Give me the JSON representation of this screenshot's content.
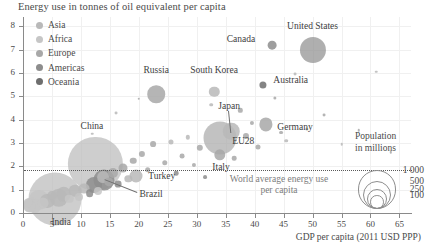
{
  "chart_data": {
    "type": "scatter",
    "title": "Energy use in tonnes of oil equivalent per capita",
    "xlabel": "GDP per capita (2011 USD PPP)",
    "ylabel": "Energy use in tonnes of oil equivalent per capita",
    "xlim": [
      0,
      67
    ],
    "ylim": [
      0,
      8.4
    ],
    "xticks": [
      "0",
      "5",
      "10",
      "15",
      "20",
      "25",
      "30",
      "35",
      "40",
      "45",
      "50",
      "55",
      "60",
      "65"
    ],
    "xtick_values": [
      0,
      5,
      10,
      15,
      20,
      25,
      30,
      35,
      40,
      45,
      50,
      55,
      60,
      65
    ],
    "yticks": [
      "0",
      "1",
      "2",
      "3",
      "4",
      "5",
      "6",
      "7",
      "8"
    ],
    "ytick_values": [
      0,
      1,
      2,
      3,
      4,
      5,
      6,
      7,
      8
    ],
    "grid": true,
    "legend_position": "top-left",
    "size_encoding": "Population in millions",
    "legend": [
      {
        "label": "Asia",
        "color": "#b9b9b9"
      },
      {
        "label": "Africa",
        "color": "#c6c6c6"
      },
      {
        "label": "Europe",
        "color": "#a8a8a8"
      },
      {
        "label": "Americas",
        "color": "#8d8d8d"
      },
      {
        "label": "Oceania",
        "color": "#6e6e6e"
      }
    ],
    "annotations": [
      {
        "text": "World average energy use per capita",
        "y_value": 1.85,
        "kind": "reference-line"
      }
    ],
    "size_legend": {
      "title_line1": "Population",
      "title_line2": "in millions",
      "entries": [
        "1 000",
        "500",
        "250",
        "100"
      ],
      "values": [
        1000,
        500,
        250,
        100
      ]
    },
    "labeled_points": [
      {
        "name": "United States",
        "x": 50.0,
        "y": 7.0,
        "pop": 320,
        "region": "Americas"
      },
      {
        "name": "Canada",
        "x": 43.0,
        "y": 7.2,
        "pop": 36,
        "region": "Americas"
      },
      {
        "name": "Australia",
        "x": 41.5,
        "y": 5.5,
        "pop": 24,
        "region": "Oceania"
      },
      {
        "name": "South Korea",
        "x": 33.0,
        "y": 5.2,
        "pop": 51,
        "region": "Asia"
      },
      {
        "name": "Russia",
        "x": 23.0,
        "y": 5.1,
        "pop": 144,
        "region": "Europe"
      },
      {
        "name": "Germany",
        "x": 42.0,
        "y": 3.8,
        "pop": 82,
        "region": "Europe"
      },
      {
        "name": "Japan",
        "x": 36.0,
        "y": 3.5,
        "pop": 127,
        "region": "Asia"
      },
      {
        "name": "EU28",
        "x": 34.0,
        "y": 3.2,
        "pop": 510,
        "region": "Europe"
      },
      {
        "name": "Italy",
        "x": 34.0,
        "y": 2.5,
        "pop": 61,
        "region": "Europe"
      },
      {
        "name": "China",
        "x": 12.5,
        "y": 2.1,
        "pop": 1380,
        "region": "Asia"
      },
      {
        "name": "Turkey",
        "x": 19.5,
        "y": 1.6,
        "pop": 79,
        "region": "Asia"
      },
      {
        "name": "Brazil",
        "x": 14.0,
        "y": 1.4,
        "pop": 208,
        "region": "Americas"
      },
      {
        "name": "India",
        "x": 5.5,
        "y": 0.6,
        "pop": 1320,
        "region": "Asia"
      }
    ],
    "other_points": [
      {
        "x": 2.0,
        "y": 0.3,
        "pop": 90,
        "region": "Africa"
      },
      {
        "x": 1.4,
        "y": 0.36,
        "pop": 105,
        "region": "Africa"
      },
      {
        "x": 1.1,
        "y": 0.28,
        "pop": 60,
        "region": "Africa"
      },
      {
        "x": 0.9,
        "y": 0.45,
        "pop": 40,
        "region": "Africa"
      },
      {
        "x": 2.8,
        "y": 0.55,
        "pop": 190,
        "region": "Africa"
      },
      {
        "x": 3.4,
        "y": 0.42,
        "pop": 55,
        "region": "Africa"
      },
      {
        "x": 4.2,
        "y": 0.52,
        "pop": 95,
        "region": "Asia"
      },
      {
        "x": 5.0,
        "y": 0.75,
        "pop": 45,
        "region": "Asia"
      },
      {
        "x": 6.2,
        "y": 0.66,
        "pop": 160,
        "region": "Asia"
      },
      {
        "x": 7.0,
        "y": 0.8,
        "pop": 100,
        "region": "Asia"
      },
      {
        "x": 8.0,
        "y": 0.62,
        "pop": 35,
        "region": "Africa"
      },
      {
        "x": 9.0,
        "y": 0.95,
        "pop": 75,
        "region": "Asia"
      },
      {
        "x": 9.6,
        "y": 0.7,
        "pop": 30,
        "region": "Africa"
      },
      {
        "x": 10.5,
        "y": 1.05,
        "pop": 55,
        "region": "Asia"
      },
      {
        "x": 11.5,
        "y": 0.85,
        "pop": 28,
        "region": "Americas"
      },
      {
        "x": 12.2,
        "y": 1.2,
        "pop": 120,
        "region": "Americas"
      },
      {
        "x": 13.0,
        "y": 0.95,
        "pop": 30,
        "region": "Africa"
      },
      {
        "x": 13.8,
        "y": 1.55,
        "pop": 65,
        "region": "Asia"
      },
      {
        "x": 14.8,
        "y": 1.35,
        "pop": 40,
        "region": "Europe"
      },
      {
        "x": 15.6,
        "y": 1.7,
        "pop": 48,
        "region": "Europe"
      },
      {
        "x": 16.4,
        "y": 1.25,
        "pop": 22,
        "region": "Americas"
      },
      {
        "x": 17.2,
        "y": 1.95,
        "pop": 38,
        "region": "Europe"
      },
      {
        "x": 18.2,
        "y": 1.45,
        "pop": 25,
        "region": "Asia"
      },
      {
        "x": 19.0,
        "y": 2.25,
        "pop": 20,
        "region": "Europe"
      },
      {
        "x": 20.5,
        "y": 2.55,
        "pop": 18,
        "region": "Europe"
      },
      {
        "x": 21.5,
        "y": 1.85,
        "pop": 15,
        "region": "Europe"
      },
      {
        "x": 22.5,
        "y": 2.95,
        "pop": 16,
        "region": "Europe"
      },
      {
        "x": 24.5,
        "y": 2.15,
        "pop": 14,
        "region": "Europe"
      },
      {
        "x": 25.5,
        "y": 3.05,
        "pop": 12,
        "region": "Asia"
      },
      {
        "x": 26.5,
        "y": 1.7,
        "pop": 10,
        "region": "Americas"
      },
      {
        "x": 27.5,
        "y": 2.45,
        "pop": 11,
        "region": "Europe"
      },
      {
        "x": 28.5,
        "y": 3.25,
        "pop": 9,
        "region": "Asia"
      },
      {
        "x": 29.5,
        "y": 2.05,
        "pop": 8,
        "region": "Europe"
      },
      {
        "x": 30.5,
        "y": 2.8,
        "pop": 19,
        "region": "Europe"
      },
      {
        "x": 31.5,
        "y": 1.55,
        "pop": 7,
        "region": "Americas"
      },
      {
        "x": 32.5,
        "y": 4.65,
        "pop": 6,
        "region": "Asia"
      },
      {
        "x": 36.5,
        "y": 2.35,
        "pop": 10,
        "region": "Europe"
      },
      {
        "x": 37.5,
        "y": 4.4,
        "pop": 9,
        "region": "Europe"
      },
      {
        "x": 38.5,
        "y": 3.3,
        "pop": 17,
        "region": "Europe"
      },
      {
        "x": 39.5,
        "y": 3.85,
        "pop": 8,
        "region": "Europe"
      },
      {
        "x": 40.5,
        "y": 2.85,
        "pop": 12,
        "region": "Europe"
      },
      {
        "x": 43.5,
        "y": 4.95,
        "pop": 5,
        "region": "Europe"
      },
      {
        "x": 44.5,
        "y": 3.45,
        "pop": 7,
        "region": "Europe"
      },
      {
        "x": 45.5,
        "y": 3.1,
        "pop": 6,
        "region": "Asia"
      },
      {
        "x": 47.0,
        "y": 5.95,
        "pop": 4,
        "region": "Asia"
      },
      {
        "x": 49.0,
        "y": 3.6,
        "pop": 5,
        "region": "Europe"
      },
      {
        "x": 52.0,
        "y": 4.2,
        "pop": 4,
        "region": "Europe"
      },
      {
        "x": 55.0,
        "y": 2.95,
        "pop": 3,
        "region": "Asia"
      },
      {
        "x": 58.0,
        "y": 3.55,
        "pop": 3,
        "region": "Europe"
      },
      {
        "x": 61.0,
        "y": 6.05,
        "pop": 3,
        "region": "Asia"
      },
      {
        "x": 63.5,
        "y": 2.6,
        "pop": 2,
        "region": "Europe"
      },
      {
        "x": 16.0,
        "y": 4.3,
        "pop": 4,
        "region": "Asia"
      },
      {
        "x": 20.0,
        "y": 4.9,
        "pop": 3,
        "region": "Europe"
      },
      {
        "x": 12.0,
        "y": 3.4,
        "pop": 3,
        "region": "Asia"
      }
    ]
  }
}
